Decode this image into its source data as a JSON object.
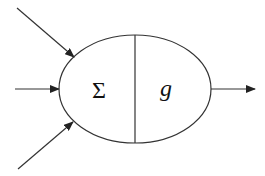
{
  "diagram": {
    "type": "neuron-model",
    "colors": {
      "stroke": "#333333",
      "text": "#111111",
      "background": "#ffffff"
    },
    "node": {
      "shape": "ellipse",
      "center": [
        135,
        89
      ],
      "rx": 76,
      "ry": 54,
      "divider": "vertical",
      "left_label": "Σ",
      "right_label": "g",
      "left_meaning": "summation",
      "right_meaning": "activation function"
    },
    "inputs": [
      {
        "from": [
          17,
          8
        ],
        "to": [
          74,
          57
        ]
      },
      {
        "from": [
          15,
          89
        ],
        "to": [
          59,
          89
        ]
      },
      {
        "from": [
          18,
          169
        ],
        "to": [
          73,
          122
        ]
      }
    ],
    "output": {
      "from": [
        211,
        89
      ],
      "to": [
        255,
        89
      ]
    }
  }
}
